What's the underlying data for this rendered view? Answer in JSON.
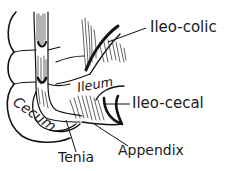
{
  "figure": {
    "colors": {
      "ink": "#111111",
      "background": "#ffffff"
    }
  },
  "labels": {
    "ileo_colic": "Ileo-colic",
    "ileum": "Ileum",
    "ileo_cecal": "Ileo-cecal",
    "cecum": "Cecum",
    "tenia": "Tenia",
    "appendix": "Appendix"
  }
}
